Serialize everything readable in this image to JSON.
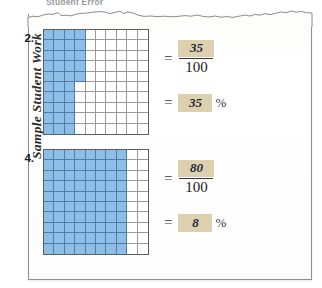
{
  "heading": {
    "text": "Student Error"
  },
  "side_label": {
    "text": "Sample Student Work"
  },
  "colors": {
    "shaded_cell": "#8dbfe6",
    "shaded_cell_line": "#4d7ca8",
    "grid_line": "#9a9a9a",
    "grid_border": "#5e5e5e",
    "highlight": "#ddd0ae",
    "paper": "#fdfdfc",
    "paper_edge": "#8e8e93",
    "ink": "#1e2a3a"
  },
  "grid_spec": {
    "columns": 10,
    "rows": 10,
    "total_cells": 100
  },
  "problems": [
    {
      "number": "2.",
      "shaded_count": 35,
      "shading": {
        "full_columns": 3,
        "partial_column_index": 3,
        "partial_column_rows": 5
      },
      "equals_sign": "=",
      "fraction": {
        "numerator": "35",
        "denominator": "100"
      },
      "percent": {
        "value": "35",
        "sign": "%"
      }
    },
    {
      "number": "4.",
      "shaded_count": 80,
      "shading": {
        "full_columns": 8,
        "partial_column_index": -1,
        "partial_column_rows": 0
      },
      "equals_sign": "=",
      "fraction": {
        "numerator": "80",
        "denominator": "100"
      },
      "percent": {
        "value": "8",
        "sign": "%"
      }
    }
  ]
}
